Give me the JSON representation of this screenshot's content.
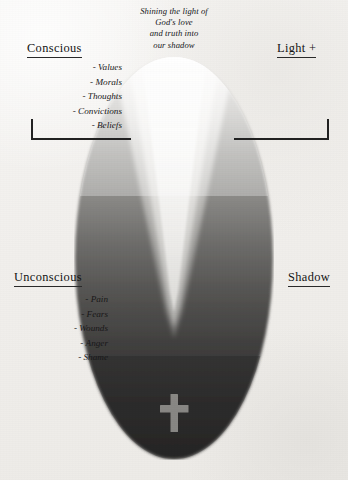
{
  "caption": {
    "lines": [
      "Shining the light of",
      "God's love",
      "and truth into",
      "our shadow"
    ]
  },
  "headings": {
    "conscious": "Conscious",
    "light": "Light +",
    "unconscious": "Unconscious",
    "shadow": "Shadow"
  },
  "conscious_traits": [
    "- Values",
    "- Morals",
    "- Thoughts",
    "- Convictions",
    "- Beliefs"
  ],
  "unconscious_traits": [
    "- Pain",
    "- Fears",
    "- Wounds",
    "- Anger",
    "- Shame"
  ],
  "symbols": {
    "cross": "latin-cross"
  },
  "colors": {
    "paper": "#f3f2f0",
    "ink": "#1c1b1a",
    "oval_top_light": "#f0efed",
    "oval_mid": "#8e8d8b",
    "oval_bottom_dark": "#2e2d2c",
    "beam_core": "#f2f1ef",
    "beam_mid": "#c9c8c5",
    "cross": "#9a9995",
    "bracket": "#222222"
  }
}
